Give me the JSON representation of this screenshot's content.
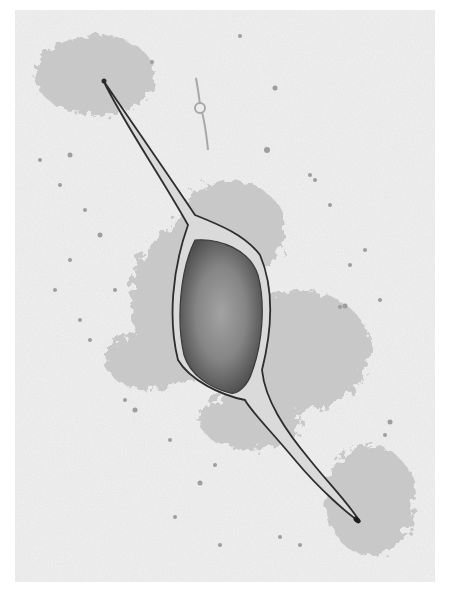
{
  "image": {
    "subject": "Illustration of a bipolar cell with spindle-shaped body and two tapering processes",
    "style": "grayscale stippled pencil drawing",
    "colors": {
      "background": "#ffffff",
      "panel": "#f1f1f1",
      "stipple": "#b9b9b9",
      "outline": "#2e2e2e",
      "body_fill": "#7a7a7a",
      "body_core": "#9a9a9a",
      "membrane": "#d8d8d8"
    }
  }
}
